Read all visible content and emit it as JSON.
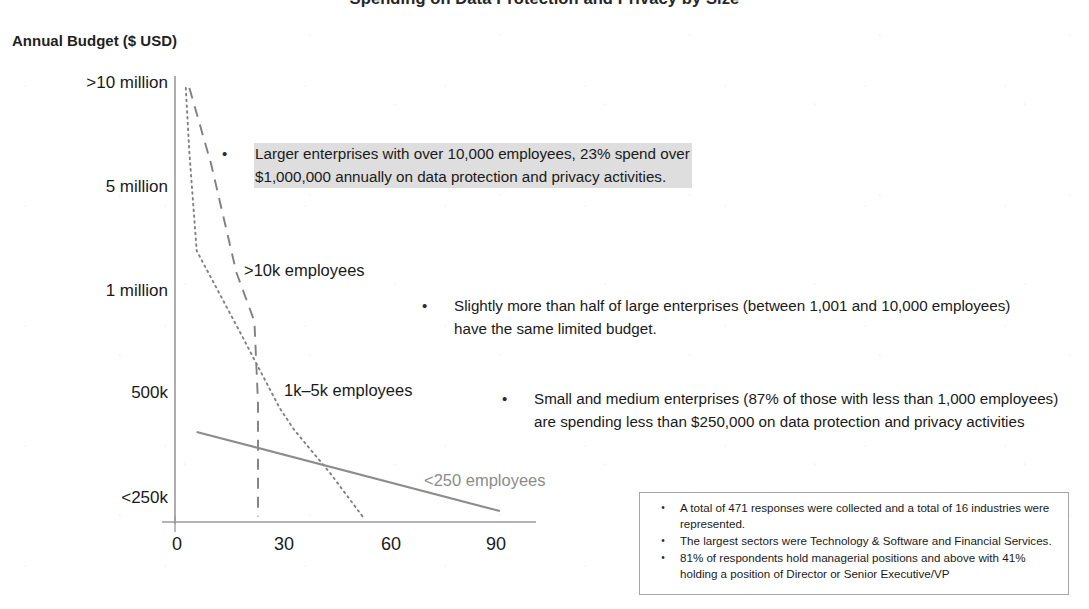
{
  "slide": {
    "title": "Spending on Data Protection and Privacy by Size"
  },
  "chart_data": {
    "type": "line",
    "title": "Spending on Data Protection and Privacy by Size",
    "xlabel": "",
    "ylabel": "Annual Budget ($ USD)",
    "xlim": [
      0,
      100
    ],
    "ylim": [
      0,
      4
    ],
    "grid": false,
    "legend_position": "inline-labels",
    "x_ticks": [
      "0",
      "30",
      "60",
      "90"
    ],
    "x_tick_values": [
      0,
      30,
      60,
      90
    ],
    "y_ticks": [
      "<250k",
      "500k",
      "1 million",
      "5 million",
      ">10 million"
    ],
    "y_tick_values": [
      0,
      1,
      2,
      3,
      4
    ],
    "xaxis_note": "Percent of respondents",
    "series": [
      {
        "name": ">10k employees",
        "style": "dashed",
        "color": "#808080",
        "x": [
          4,
          10,
          17,
          22,
          23,
          23
        ],
        "y": [
          4.0,
          3.3,
          2.3,
          1.85,
          1.1,
          0.05
        ]
      },
      {
        "name": "1k–5k employees",
        "style": "dotted",
        "color": "#808080",
        "x": [
          3,
          4,
          6,
          18,
          29,
          33,
          43,
          52
        ],
        "y": [
          4.0,
          3.4,
          2.5,
          1.75,
          1.05,
          0.85,
          0.45,
          0.05
        ]
      },
      {
        "name": "<250 employees",
        "style": "solid",
        "color": "#8c8c8c",
        "x": [
          6,
          90
        ],
        "y": [
          0.83,
          0.1
        ]
      }
    ]
  },
  "series_labels": [
    {
      "id": "series-label-1",
      "text": ">10k employees"
    },
    {
      "id": "series-label-2",
      "text": "1k–5k employees"
    },
    {
      "id": "series-label-3",
      "text": "<250 employees"
    }
  ],
  "callouts": [
    {
      "bullet": "•",
      "text": "Larger enterprises with over 10,000 employees, 23% spend over $1,000,000 annually on data protection and privacy activities.",
      "highlighted": true
    },
    {
      "bullet": "•",
      "text": "Slightly more than half of large enterprises (between 1,001 and 10,000 employees) have the same limited budget.",
      "highlighted": false
    },
    {
      "bullet": "•",
      "text": "Small and medium enterprises (87% of those with less than 1,000 employees) are spending less than $250,000 on data protection and privacy activities",
      "highlighted": false
    }
  ],
  "footnote": {
    "items": [
      {
        "bullet": "•",
        "text": "A total of 471 responses were collected and a total of 16 industries were represented."
      },
      {
        "bullet": "•",
        "text": "The largest sectors were Technology & Software and Financial Services."
      },
      {
        "bullet": "•",
        "text": "81% of respondents hold managerial positions and above with 41% holding a position of Director or Senior Executive/VP"
      }
    ]
  },
  "colors": {
    "axis": "#9a9a9a",
    "series_gray": "#808080",
    "series_light_gray": "#8c8c8c",
    "highlight": "#dedede",
    "text": "#1a1a1a"
  }
}
